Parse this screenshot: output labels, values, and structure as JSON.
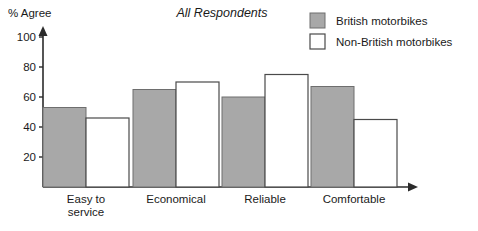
{
  "chart_data": {
    "type": "bar",
    "title": "All Respondents",
    "ylabel": "% Agree",
    "xlabel": "",
    "categories": [
      "Easy to service",
      "Economical",
      "Reliable",
      "Comfortable"
    ],
    "category_lines": [
      [
        "Easy to",
        "service"
      ],
      [
        "Economical"
      ],
      [
        "Reliable"
      ],
      [
        "Comfortable"
      ]
    ],
    "series": [
      {
        "name": "British motorbikes",
        "values": [
          53,
          65,
          60,
          67
        ],
        "color": "#a8a8a8",
        "style": "filled"
      },
      {
        "name": "Non-British motorbikes",
        "values": [
          46,
          70,
          75,
          45
        ],
        "color": "#ffffff",
        "style": "open"
      }
    ],
    "ylim": [
      0,
      100
    ],
    "yticks": [
      20,
      40,
      60,
      80,
      100
    ],
    "ytick_labels": [
      "20",
      "40",
      "60",
      "80",
      "100"
    ],
    "grid": false,
    "legend_position": "top-right",
    "axis_arrows": true
  },
  "legend": {
    "items": [
      {
        "label": "British motorbikes",
        "swatch": "filled-gray-swatch"
      },
      {
        "label": "Non-British motorbikes",
        "swatch": "open-white-swatch"
      }
    ]
  },
  "colors": {
    "bar_fill": "#a8a8a8",
    "bar_outline": "#6e6e6e",
    "open_outline": "#4a4a4a",
    "axis": "#2b2b2b",
    "text": "#1a1a1a",
    "background": "#ffffff"
  }
}
